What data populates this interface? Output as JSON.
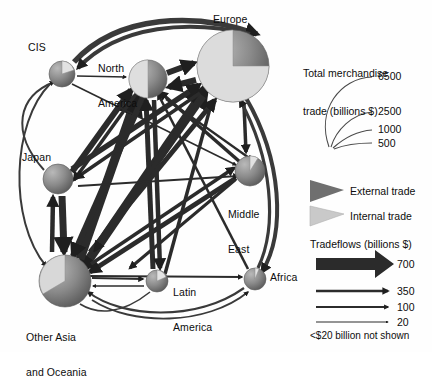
{
  "figure": {
    "type": "network-flow-diagram",
    "title_visible": false,
    "background": "#ffffff",
    "ink": "#1a1a1a",
    "external_color": "#6a6a6a",
    "internal_color": "#c9c9c9"
  },
  "nodes": [
    {
      "id": "cis",
      "label": "CIS",
      "label_lines": [
        "CIS"
      ],
      "cx": 62,
      "cy": 74,
      "r": 13,
      "total_trade": 150,
      "internal_share": 0.14,
      "label_x": 28,
      "label_y": 48
    },
    {
      "id": "north_america",
      "label": "North America",
      "label_lines": [
        "North",
        "America"
      ],
      "cx": 148,
      "cy": 79,
      "r": 19,
      "total_trade": 1200,
      "internal_share": 0.45,
      "label_x": 98,
      "label_y": 46
    },
    {
      "id": "europe",
      "label": "Europe",
      "label_lines": [
        "Europe"
      ],
      "cx": 233,
      "cy": 66,
      "r": 36,
      "total_trade": 6500,
      "internal_share": 0.72,
      "label_x": 212,
      "label_y": 18
    },
    {
      "id": "japan",
      "label": "Japan",
      "label_lines": [
        "Japan"
      ],
      "cx": 58,
      "cy": 179,
      "r": 15,
      "total_trade": 700,
      "internal_share": 0.0,
      "label_x": 22,
      "label_y": 157
    },
    {
      "id": "middle_east",
      "label": "Middle East",
      "label_lines": [
        "Middle",
        "East"
      ],
      "cx": 250,
      "cy": 171,
      "r": 15,
      "total_trade": 330,
      "internal_share": 0.1,
      "label_x": 228,
      "label_y": 189
    },
    {
      "id": "other_asia_oceania",
      "label": "Other Asia and Oceania",
      "label_lines": [
        "Other Asia",
        "and Oceania"
      ],
      "cx": 65,
      "cy": 281,
      "r": 26,
      "total_trade": 2500,
      "internal_share": 0.42,
      "label_x": 28,
      "label_y": 312
    },
    {
      "id": "latin_america",
      "label": "Latin America",
      "label_lines": [
        "Latin",
        "America"
      ],
      "cx": 157,
      "cy": 281,
      "r": 11,
      "total_trade": 250,
      "internal_share": 0.18,
      "label_x": 172,
      "label_y": 268
    },
    {
      "id": "africa",
      "label": "Africa",
      "label_lines": [
        "Africa"
      ],
      "cx": 255,
      "cy": 279,
      "r": 11,
      "total_trade": 180,
      "internal_share": 0.1,
      "label_x": 270,
      "label_y": 273
    }
  ],
  "legend_size": {
    "title_lines": [
      "Total merchandise",
      "trade (billions $)"
    ],
    "title_x": 320,
    "title_y": 48,
    "units": "billions $",
    "entries": [
      {
        "value": 6500,
        "label": "6500",
        "radius": 58,
        "label_x": 382,
        "label_y": 78
      },
      {
        "value": 2500,
        "label": "2500",
        "radius": 36,
        "label_x": 382,
        "label_y": 113
      },
      {
        "value": 1000,
        "label": "1000",
        "radius": 23,
        "label_x": 382,
        "label_y": 131
      },
      {
        "value": 500,
        "label": "500",
        "radius": 16,
        "label_x": 382,
        "label_y": 144
      }
    ]
  },
  "legend_trade_type": {
    "entries": [
      {
        "id": "external",
        "label": "External trade",
        "color": "#6a6a6a",
        "y": 190
      },
      {
        "id": "internal",
        "label": "Internal trade",
        "color": "#c9c9c9",
        "y": 214
      }
    ],
    "label_x": 348
  },
  "legend_flows": {
    "title": "Tradeflows (billions $)",
    "title_x": 313,
    "title_y": 244,
    "footnote": "<$20 billion not shown",
    "footnote_x": 313,
    "footnote_y": 336,
    "entries": [
      {
        "value": 700,
        "label": "700",
        "width": 13,
        "y": 264,
        "label_x": 398
      },
      {
        "value": 350,
        "label": "350",
        "width": 5,
        "y": 291,
        "label_x": 398
      },
      {
        "value": 100,
        "label": "100",
        "width": 3,
        "y": 307,
        "label_x": 398
      },
      {
        "value": 20,
        "label": "20",
        "width": 1.4,
        "y": 322,
        "label_x": 398
      }
    ]
  },
  "flows": [
    {
      "from": "cis",
      "to": "europe",
      "value": 110,
      "style": "arc-top"
    },
    {
      "from": "europe",
      "to": "cis",
      "value": 150,
      "style": "arc-top"
    },
    {
      "from": "cis",
      "to": "north_america",
      "value": 30,
      "style": "straight"
    },
    {
      "from": "north_america",
      "to": "europe",
      "value": 160,
      "style": "straight"
    },
    {
      "from": "europe",
      "to": "north_america",
      "value": 190,
      "style": "straight"
    },
    {
      "from": "europe",
      "to": "middle_east",
      "value": 90,
      "style": "straight"
    },
    {
      "from": "europe",
      "to": "africa",
      "value": 60,
      "style": "arc-right"
    },
    {
      "from": "africa",
      "to": "europe",
      "value": 55,
      "style": "arc-right"
    },
    {
      "from": "japan",
      "to": "other_asia_oceania",
      "value": 180,
      "style": "straight"
    },
    {
      "from": "other_asia_oceania",
      "to": "japan",
      "value": 140,
      "style": "straight"
    },
    {
      "from": "other_asia_oceania",
      "to": "latin_america",
      "value": 40,
      "style": "straight"
    },
    {
      "from": "latin_america",
      "to": "other_asia_oceania",
      "value": 25,
      "style": "straight"
    },
    {
      "from": "other_asia_oceania",
      "to": "europe",
      "value": 230,
      "style": "straight"
    },
    {
      "from": "europe",
      "to": "other_asia_oceania",
      "value": 200,
      "style": "straight"
    },
    {
      "from": "other_asia_oceania",
      "to": "north_america",
      "value": 260,
      "style": "straight"
    },
    {
      "from": "north_america",
      "to": "other_asia_oceania",
      "value": 150,
      "style": "straight"
    },
    {
      "from": "japan",
      "to": "north_america",
      "value": 130,
      "style": "straight"
    },
    {
      "from": "north_america",
      "to": "japan",
      "value": 70,
      "style": "straight"
    },
    {
      "from": "japan",
      "to": "europe",
      "value": 90,
      "style": "straight"
    },
    {
      "from": "europe",
      "to": "japan",
      "value": 60,
      "style": "straight"
    },
    {
      "from": "latin_america",
      "to": "north_america",
      "value": 120,
      "style": "straight"
    },
    {
      "from": "north_america",
      "to": "latin_america",
      "value": 110,
      "style": "straight"
    },
    {
      "from": "middle_east",
      "to": "other_asia_oceania",
      "value": 80,
      "style": "straight"
    },
    {
      "from": "other_asia_oceania",
      "to": "middle_east",
      "value": 70,
      "style": "straight"
    },
    {
      "from": "africa",
      "to": "other_asia_oceania",
      "value": 30,
      "style": "arc-bottom"
    },
    {
      "from": "other_asia_oceania",
      "to": "africa",
      "value": 25,
      "style": "arc-bottom"
    },
    {
      "from": "japan",
      "to": "cis",
      "value": 20,
      "style": "arc-left"
    },
    {
      "from": "cis",
      "to": "other_asia_oceania",
      "value": 22,
      "style": "arc-left"
    },
    {
      "from": "middle_east",
      "to": "north_america",
      "value": 35,
      "style": "straight"
    },
    {
      "from": "africa",
      "to": "north_america",
      "value": 22,
      "style": "straight"
    },
    {
      "from": "latin_america",
      "to": "europe",
      "value": 45,
      "style": "straight"
    }
  ]
}
